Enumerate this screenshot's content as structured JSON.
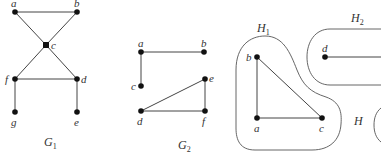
{
  "figure": {
    "graphs": [
      {
        "id": "G1",
        "label": "G",
        "label_sub": "1",
        "vertices": [
          {
            "name": "a",
            "x": 15,
            "y": 12
          },
          {
            "name": "b",
            "x": 77,
            "y": 12
          },
          {
            "name": "c",
            "x": 46,
            "y": 45
          },
          {
            "name": "f",
            "x": 15,
            "y": 79
          },
          {
            "name": "d",
            "x": 77,
            "y": 79
          },
          {
            "name": "g",
            "x": 15,
            "y": 112
          },
          {
            "name": "e",
            "x": 77,
            "y": 112
          }
        ],
        "edges": [
          [
            "a",
            "b"
          ],
          [
            "a",
            "c"
          ],
          [
            "b",
            "c"
          ],
          [
            "c",
            "f"
          ],
          [
            "c",
            "d"
          ],
          [
            "f",
            "d"
          ],
          [
            "f",
            "g"
          ],
          [
            "d",
            "e"
          ]
        ]
      },
      {
        "id": "G2",
        "label": "G",
        "label_sub": "2",
        "vertices": [
          {
            "name": "a",
            "x": 141,
            "y": 52
          },
          {
            "name": "b",
            "x": 204,
            "y": 52
          },
          {
            "name": "c",
            "x": 141,
            "y": 86
          },
          {
            "name": "e",
            "x": 205,
            "y": 79
          },
          {
            "name": "d",
            "x": 141,
            "y": 111
          },
          {
            "name": "f",
            "x": 205,
            "y": 111
          }
        ],
        "edges": [
          [
            "a",
            "b"
          ],
          [
            "a",
            "c"
          ],
          [
            "d",
            "e"
          ],
          [
            "d",
            "f"
          ],
          [
            "e",
            "f"
          ]
        ]
      },
      {
        "id": "H",
        "label": "H",
        "components": [
          {
            "id": "H1",
            "label": "H",
            "label_sub": "1",
            "vertices": [
              {
                "name": "b",
                "x": 257,
                "y": 57
              },
              {
                "name": "a",
                "x": 257,
                "y": 118
              },
              {
                "name": "c",
                "x": 322,
                "y": 118
              }
            ],
            "edges": [
              [
                "b",
                "a"
              ],
              [
                "a",
                "c"
              ],
              [
                "b",
                "c"
              ]
            ]
          },
          {
            "id": "H2",
            "label": "H",
            "label_sub": "2",
            "vertices": [
              {
                "name": "d",
                "x": 325,
                "y": 57
              }
            ],
            "edges": [
              [
                "d",
                "offscreen-right"
              ]
            ]
          }
        ]
      }
    ]
  }
}
